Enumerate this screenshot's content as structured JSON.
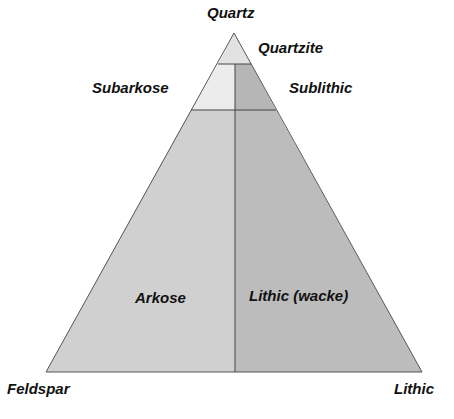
{
  "diagram": {
    "type": "ternary-classification",
    "vertices": {
      "top": "Quartz",
      "bottom_left": "Feldspar",
      "bottom_right": "Lithic"
    },
    "fields": [
      {
        "name": "Quartzite",
        "color": "#e2e2e2"
      },
      {
        "name": "Subarkose",
        "color": "#ececec"
      },
      {
        "name": "Sublithic",
        "color": "#b6b6b6"
      },
      {
        "name": "Arkose",
        "color": "#d0d0d0"
      },
      {
        "name": "Lithic (wacke)",
        "color": "#bcbcbc"
      }
    ],
    "line_color": "#555555"
  }
}
